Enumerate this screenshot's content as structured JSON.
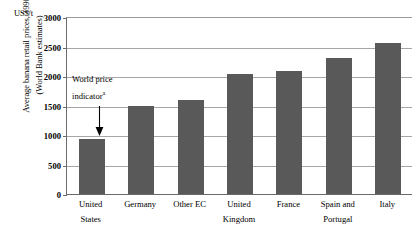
{
  "chart_data": {
    "type": "bar",
    "title": "",
    "subtitle": "",
    "xlabel": "",
    "ylabel": "Average banana retail prices, 1990 (World Bank estimates)",
    "ylabel_lines": [
      "Average banana retail prices, 1990",
      "(World Bank estimates)"
    ],
    "unit_label": "US$/t",
    "ylim": [
      0,
      3000
    ],
    "ytick_values": [
      0,
      500,
      1000,
      1500,
      2000,
      2500,
      3000
    ],
    "ytick_labels": [
      "0",
      "500",
      "1000",
      "1500",
      "2000",
      "2500",
      "3000"
    ],
    "grid": true,
    "legend": "none",
    "categories": [
      "United States",
      "Germany",
      "Other EC",
      "United Kingdom",
      "France",
      "Spain and Portugal",
      "Italy"
    ],
    "category_label_lines": [
      [
        "United",
        "States"
      ],
      [
        "Germany",
        ""
      ],
      [
        "Other EC",
        ""
      ],
      [
        "United",
        "Kingdom"
      ],
      [
        "France",
        ""
      ],
      [
        "Spain and",
        "Portugal"
      ],
      [
        "Italy",
        ""
      ]
    ],
    "values": [
      930,
      1490,
      1600,
      2040,
      2080,
      2300,
      2560
    ],
    "bar_color": "#595959",
    "annotations": [
      {
        "text_line1": "World price",
        "text_line2": "indicator",
        "footnote_marker": "a",
        "points_to_category": "United States",
        "arrow": "down-arrow"
      }
    ]
  }
}
